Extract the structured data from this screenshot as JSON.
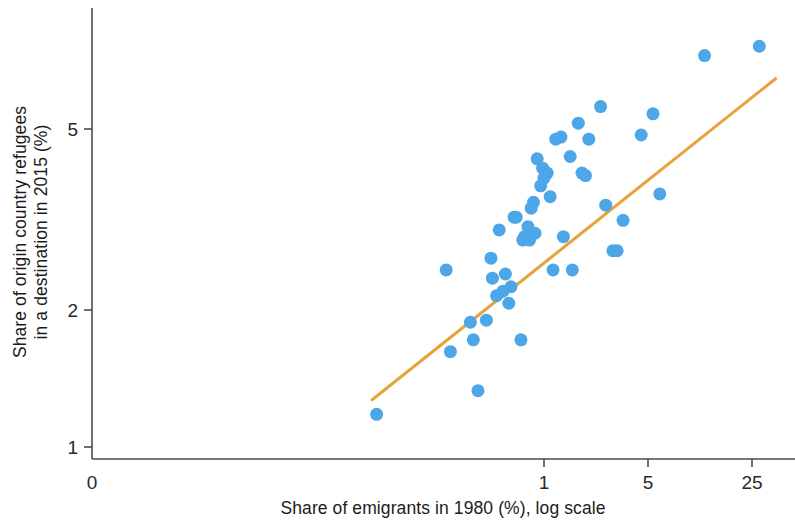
{
  "chart_data": {
    "type": "scatter",
    "title": "",
    "xlabel": "Share of emigrants in 1980 (%), log scale",
    "ylabel": "Share of origin country refugees in a destination in 2015 (%)",
    "ylabel_line1": "Share of origin country refugees",
    "ylabel_line2": "in a destination in 2015 (%)",
    "x_scale": "log",
    "y_scale": "log",
    "x_tick_labels": [
      "0",
      "1",
      "5",
      "25"
    ],
    "x_tick_values": [
      0,
      1,
      5,
      25
    ],
    "y_tick_labels": [
      "1",
      "2",
      "5"
    ],
    "y_tick_values": [
      1,
      2,
      5
    ],
    "xlim": [
      0.06,
      40
    ],
    "ylim": [
      0.95,
      8.2
    ],
    "grid": false,
    "legend": null,
    "marker_color": "#4da6e8",
    "marker_size_px": 13,
    "trendline": {
      "color": "#e8a33d",
      "label": "fitted line",
      "x_start": 0.07,
      "y_start": 1.27,
      "x_end": 36.0,
      "y_end": 6.45
    },
    "points": [
      {
        "x": 0.075,
        "y": 1.18
      },
      {
        "x": 0.22,
        "y": 2.45
      },
      {
        "x": 0.235,
        "y": 1.62
      },
      {
        "x": 0.32,
        "y": 1.88
      },
      {
        "x": 0.335,
        "y": 1.72
      },
      {
        "x": 0.36,
        "y": 1.33
      },
      {
        "x": 0.41,
        "y": 1.9
      },
      {
        "x": 0.44,
        "y": 2.6
      },
      {
        "x": 0.45,
        "y": 2.35
      },
      {
        "x": 0.48,
        "y": 2.15
      },
      {
        "x": 0.5,
        "y": 3.0
      },
      {
        "x": 0.53,
        "y": 2.2
      },
      {
        "x": 0.55,
        "y": 2.4
      },
      {
        "x": 0.58,
        "y": 2.07
      },
      {
        "x": 0.6,
        "y": 2.25
      },
      {
        "x": 0.63,
        "y": 3.2
      },
      {
        "x": 0.65,
        "y": 3.2
      },
      {
        "x": 0.7,
        "y": 1.72
      },
      {
        "x": 0.72,
        "y": 2.85
      },
      {
        "x": 0.74,
        "y": 2.9
      },
      {
        "x": 0.76,
        "y": 2.9
      },
      {
        "x": 0.78,
        "y": 3.05
      },
      {
        "x": 0.8,
        "y": 2.85
      },
      {
        "x": 0.82,
        "y": 3.35
      },
      {
        "x": 0.85,
        "y": 3.45
      },
      {
        "x": 0.87,
        "y": 2.95
      },
      {
        "x": 0.9,
        "y": 4.3
      },
      {
        "x": 0.95,
        "y": 3.75
      },
      {
        "x": 0.98,
        "y": 4.1
      },
      {
        "x": 1.0,
        "y": 3.9
      },
      {
        "x": 1.05,
        "y": 4.0
      },
      {
        "x": 1.1,
        "y": 3.55
      },
      {
        "x": 1.15,
        "y": 2.45
      },
      {
        "x": 1.2,
        "y": 4.75
      },
      {
        "x": 1.3,
        "y": 4.8
      },
      {
        "x": 1.35,
        "y": 2.9
      },
      {
        "x": 1.5,
        "y": 4.35
      },
      {
        "x": 1.55,
        "y": 2.45
      },
      {
        "x": 1.7,
        "y": 5.15
      },
      {
        "x": 1.8,
        "y": 4.0
      },
      {
        "x": 1.9,
        "y": 3.95
      },
      {
        "x": 2.0,
        "y": 4.75
      },
      {
        "x": 2.4,
        "y": 5.6
      },
      {
        "x": 2.6,
        "y": 3.4
      },
      {
        "x": 2.9,
        "y": 2.7
      },
      {
        "x": 3.1,
        "y": 2.7
      },
      {
        "x": 3.4,
        "y": 3.15
      },
      {
        "x": 4.5,
        "y": 4.85
      },
      {
        "x": 5.4,
        "y": 5.4
      },
      {
        "x": 6.0,
        "y": 3.6
      },
      {
        "x": 12.0,
        "y": 7.25
      },
      {
        "x": 28.0,
        "y": 7.6
      }
    ]
  },
  "axes": {
    "x_axis_name": "x-axis",
    "y_axis_name": "y-axis"
  }
}
